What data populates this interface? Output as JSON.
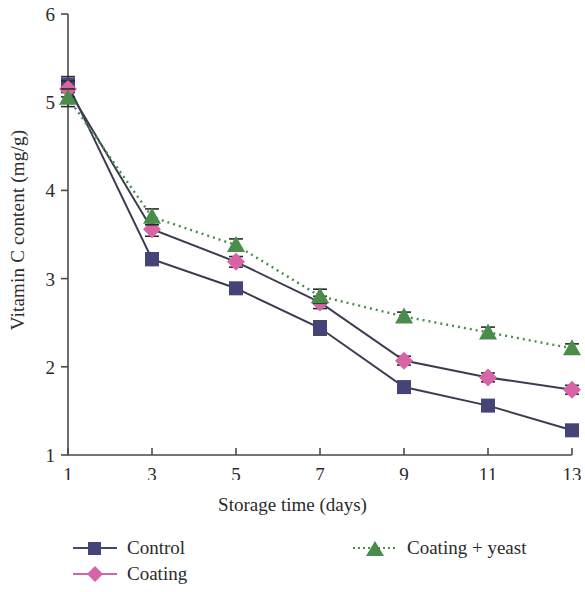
{
  "chart_data": {
    "type": "line",
    "title": "",
    "xlabel": "Storage time (days)",
    "ylabel": "Vitamin C content (mg/g)",
    "x": [
      1,
      3,
      5,
      7,
      9,
      11,
      13
    ],
    "xticklabels": [
      "1",
      "3",
      "5",
      "7",
      "9",
      "11",
      "13"
    ],
    "yticklabels": [
      "1",
      "2",
      "3",
      "4",
      "5",
      "6"
    ],
    "yticks": [
      1,
      2,
      3,
      4,
      5,
      6
    ],
    "xlim": [
      1,
      13
    ],
    "ylim": [
      1,
      6
    ],
    "grid": false,
    "legend_position": "below-plot",
    "series": [
      {
        "name": "Control",
        "marker": "square",
        "linestyle": "solid",
        "color": "#444478",
        "values": [
          5.2,
          3.22,
          2.89,
          2.44,
          1.77,
          1.56,
          1.28
        ],
        "errors": [
          0.09,
          0.07,
          0.06,
          0.08,
          0.05,
          0.05,
          0.05
        ]
      },
      {
        "name": "Coating",
        "marker": "diamond",
        "linestyle": "solid",
        "color": "#d864a8",
        "values": [
          5.15,
          3.56,
          3.19,
          2.73,
          2.07,
          1.88,
          1.74
        ],
        "errors": [
          0.09,
          0.08,
          0.06,
          0.07,
          0.05,
          0.05,
          0.05
        ]
      },
      {
        "name": "Coating + yeast",
        "marker": "triangle",
        "linestyle": "dotted",
        "color": "#4a8c4a",
        "values": [
          5.05,
          3.7,
          3.38,
          2.8,
          2.57,
          2.39,
          2.21
        ],
        "errors": [
          0.1,
          0.09,
          0.07,
          0.08,
          0.05,
          0.06,
          0.05
        ]
      }
    ]
  },
  "legend": {
    "items": [
      {
        "label": "Control"
      },
      {
        "label": "Coating"
      },
      {
        "label": "Coating + yeast"
      }
    ]
  }
}
